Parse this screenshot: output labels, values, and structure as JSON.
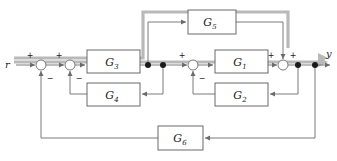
{
  "figure": {
    "kind": "control-system-block-diagram",
    "background": "#ffffff",
    "line_color": "#6b6b6b",
    "box_border_color": "#5a5a5a",
    "box_fill": "#ffffff",
    "text_color": "#1a1a1a",
    "highlight_color": "#9a9a9a"
  },
  "signals": {
    "input": {
      "name": "r-input-label",
      "label": "r"
    },
    "output": {
      "name": "y-output-label",
      "label": "y"
    }
  },
  "blocks": [
    {
      "id": "G5",
      "label": "G",
      "sub": "5",
      "x": 188,
      "y": 10,
      "w": 48,
      "h": 24
    },
    {
      "id": "G3",
      "label": "G",
      "sub": "3",
      "x": 87,
      "y": 50,
      "w": 53,
      "h": 23
    },
    {
      "id": "G1",
      "label": "G",
      "sub": "1",
      "x": 215,
      "y": 50,
      "w": 53,
      "h": 23
    },
    {
      "id": "G4",
      "label": "G",
      "sub": "4",
      "x": 87,
      "y": 83,
      "w": 53,
      "h": 23
    },
    {
      "id": "G2",
      "label": "G",
      "sub": "2",
      "x": 215,
      "y": 83,
      "w": 53,
      "h": 23
    },
    {
      "id": "G6",
      "label": "G",
      "sub": "6",
      "x": 158,
      "y": 126,
      "w": 45,
      "h": 24
    }
  ],
  "summing_junctions": [
    {
      "id": "S1",
      "cx": 41,
      "cy": 65,
      "r": 5,
      "signs": [
        {
          "text": "+",
          "dx": -11,
          "dy": -9
        },
        {
          "text": "−",
          "dx": 9,
          "dy": 14
        }
      ]
    },
    {
      "id": "S2",
      "cx": 70,
      "cy": 65,
      "r": 5,
      "signs": [
        {
          "text": "+",
          "dx": -11,
          "dy": -9
        },
        {
          "text": "−",
          "dx": 9,
          "dy": 14
        }
      ]
    },
    {
      "id": "S3",
      "cx": 193,
      "cy": 65,
      "r": 5,
      "signs": [
        {
          "text": "+",
          "dx": -11,
          "dy": -9
        },
        {
          "text": "−",
          "dx": 9,
          "dy": 14
        }
      ]
    },
    {
      "id": "S4",
      "cx": 283,
      "cy": 65,
      "r": 5,
      "signs": [
        {
          "text": "+",
          "dx": -12,
          "dy": -9
        },
        {
          "text": "+",
          "dx": 10,
          "dy": -9
        }
      ]
    }
  ],
  "nodes": [
    {
      "id": "N1",
      "cx": 148,
      "cy": 65,
      "r": 3
    },
    {
      "id": "N2",
      "cx": 163,
      "cy": 65,
      "r": 3
    },
    {
      "id": "N3",
      "cx": 298,
      "cy": 65,
      "r": 3
    },
    {
      "id": "N4",
      "cx": 315,
      "cy": 65,
      "r": 3
    }
  ],
  "paths": {
    "forward": "r → S1 → S2 → G3 → N1/N2 → S3 → G1 → S4 → N3/N4 → y",
    "feedforward_G5": "N1 → G5 → S4",
    "inner_loop_G4": "N2 → G4 → S2",
    "inner_loop_G2": "N3 → G2 → S3",
    "outer_loop_G6": "N4 → G6 → S1"
  }
}
